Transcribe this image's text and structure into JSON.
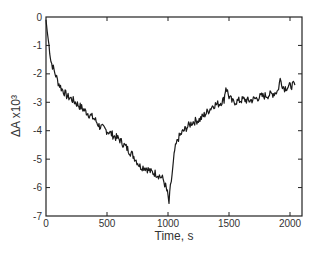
{
  "chart_data": {
    "type": "line",
    "title": "",
    "xlabel": "Time, s",
    "ylabel": "ΔA x10³",
    "xlim": [
      0,
      2100
    ],
    "ylim": [
      -7,
      0
    ],
    "xticks": [
      0,
      500,
      1000,
      1500,
      2000
    ],
    "yticks": [
      0,
      -1,
      -2,
      -3,
      -4,
      -5,
      -6,
      -7
    ],
    "grid": false,
    "legend": null,
    "series": [
      {
        "name": "ΔA",
        "color": "#1a1a1a",
        "x": [
          0,
          10,
          25,
          40,
          60,
          80,
          100,
          125,
          150,
          175,
          200,
          240,
          280,
          320,
          360,
          400,
          440,
          480,
          520,
          560,
          600,
          640,
          680,
          720,
          770,
          820,
          860,
          900,
          935,
          960,
          980,
          995,
          1008,
          1020,
          1040,
          1055,
          1080,
          1110,
          1150,
          1200,
          1262,
          1320,
          1370,
          1420,
          1460,
          1475,
          1500,
          1530,
          1580,
          1620,
          1660,
          1700,
          1760,
          1820,
          1860,
          1900,
          1920,
          1950,
          1990,
          2020,
          2040
        ],
        "y": [
          -0.1,
          -0.5,
          -1.0,
          -1.55,
          -1.8,
          -2.05,
          -2.3,
          -2.5,
          -2.65,
          -2.8,
          -2.85,
          -3.0,
          -3.15,
          -3.3,
          -3.45,
          -3.6,
          -3.85,
          -3.95,
          -4.05,
          -4.2,
          -4.3,
          -4.5,
          -4.7,
          -4.9,
          -5.25,
          -5.3,
          -5.45,
          -5.5,
          -5.6,
          -5.7,
          -5.95,
          -6.2,
          -6.55,
          -6.0,
          -5.3,
          -4.7,
          -4.3,
          -4.1,
          -3.9,
          -3.7,
          -3.6,
          -3.35,
          -3.1,
          -3.05,
          -2.9,
          -2.45,
          -2.8,
          -3.0,
          -2.95,
          -2.9,
          -2.95,
          -2.9,
          -2.8,
          -2.75,
          -2.7,
          -2.6,
          -2.2,
          -2.5,
          -2.45,
          -2.4,
          -2.4
        ]
      }
    ]
  }
}
